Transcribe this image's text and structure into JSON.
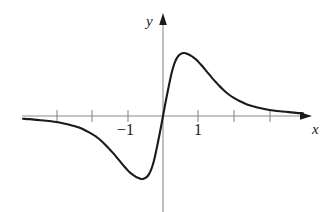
{
  "figure": {
    "kind": "function-graph",
    "background_color": "#ffffff",
    "curve_color": "#1a1a1a",
    "axis_color": "#8a8a8a"
  },
  "axes": {
    "x_axis_label": "x",
    "y_axis_label": "y",
    "origin_px": [
      163,
      116
    ],
    "unit_px": 35,
    "x_axis_y_px": 116,
    "y_axis_x_px": 163,
    "x_axis_start_px": 22,
    "x_axis_arrow_tip_px": 312,
    "y_axis_arrow_tip_px": 13,
    "y_axis_bottom_px": 212,
    "x_tick_values": [
      -3,
      -2,
      -1,
      1,
      2,
      3
    ],
    "x_tick_px": [
      57,
      92,
      128,
      198,
      234,
      270
    ],
    "x_tick_labels_shown": [
      "-1",
      "1"
    ],
    "y_tick_values": [],
    "grid": "off",
    "legend": "none"
  },
  "labels": {
    "neg_one": "−1",
    "one": "1",
    "x": "x",
    "y": "y"
  },
  "chart_data": {
    "type": "line",
    "title": "",
    "subtitle": "",
    "xlabel": "x",
    "ylabel": "y",
    "xlim": [
      -4.0,
      4.26
    ],
    "ylim": [
      -2.94,
      2.94
    ],
    "grid": false,
    "legend_position": "none",
    "annotations": [],
    "series": [
      {
        "name": "f(x)",
        "description": "odd function: rises steeply through the origin to a maximum near x = 0.57, then decays asymptotically to 0; antisymmetric minimum near x = -0.57",
        "symmetry": "odd",
        "zeros": [
          0
        ],
        "maximum": {
          "x": 0.6,
          "y": 1.8
        },
        "minimum": {
          "x": -0.6,
          "y": -1.8
        },
        "asymptote": {
          "y": 0
        },
        "x": [
          -4.0,
          -3.8,
          -3.6,
          -3.4,
          -3.2,
          -3.0,
          -2.8,
          -2.6,
          -2.4,
          -2.2,
          -2.0,
          -1.9,
          -1.8,
          -1.7,
          -1.6,
          -1.5,
          -1.4,
          -1.3,
          -1.2,
          -1.1,
          -1.0,
          -0.95,
          -0.9,
          -0.85,
          -0.8,
          -0.75,
          -0.7,
          -0.65,
          -0.6,
          -0.55,
          -0.5,
          -0.45,
          -0.4,
          -0.35,
          -0.3,
          -0.25,
          -0.2,
          -0.15,
          -0.1,
          -0.05,
          0.0,
          0.05,
          0.1,
          0.15,
          0.2,
          0.25,
          0.3,
          0.35,
          0.4,
          0.45,
          0.5,
          0.55,
          0.6,
          0.65,
          0.7,
          0.75,
          0.8,
          0.85,
          0.9,
          0.95,
          1.0,
          1.1,
          1.2,
          1.3,
          1.4,
          1.5,
          1.6,
          1.7,
          1.8,
          1.9,
          2.0,
          2.2,
          2.4,
          2.6,
          2.8,
          3.0,
          3.2,
          3.4,
          3.6,
          3.8,
          4.0
        ],
        "y": [
          -0.08,
          -0.09,
          -0.11,
          -0.13,
          -0.15,
          -0.18,
          -0.22,
          -0.27,
          -0.33,
          -0.42,
          -0.53,
          -0.6,
          -0.68,
          -0.77,
          -0.87,
          -0.98,
          -1.09,
          -1.21,
          -1.33,
          -1.45,
          -1.56,
          -1.61,
          -1.65,
          -1.69,
          -1.72,
          -1.75,
          -1.77,
          -1.79,
          -1.8,
          -1.79,
          -1.77,
          -1.73,
          -1.66,
          -1.56,
          -1.42,
          -1.24,
          -1.02,
          -0.78,
          -0.53,
          -0.27,
          0.0,
          0.27,
          0.53,
          0.78,
          1.02,
          1.24,
          1.42,
          1.56,
          1.66,
          1.73,
          1.77,
          1.79,
          1.8,
          1.79,
          1.77,
          1.75,
          1.72,
          1.69,
          1.65,
          1.61,
          1.56,
          1.45,
          1.33,
          1.21,
          1.09,
          0.98,
          0.87,
          0.77,
          0.68,
          0.6,
          0.53,
          0.42,
          0.33,
          0.27,
          0.22,
          0.18,
          0.15,
          0.13,
          0.11,
          0.09,
          0.08
        ]
      }
    ]
  }
}
